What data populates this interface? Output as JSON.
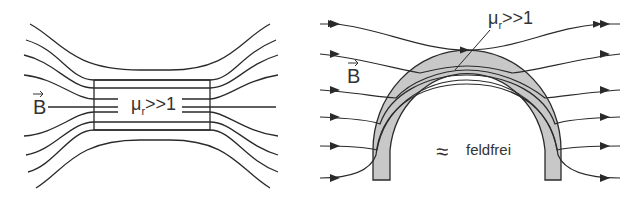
{
  "left_panel": {
    "field_label": "B",
    "material_label": {
      "symbol": "μ",
      "subscript": "r",
      "relation": ">>1"
    }
  },
  "right_panel": {
    "field_label": "B",
    "material_label": {
      "symbol": "μ",
      "subscript": "r",
      "relation": ">>1"
    },
    "interior_symbol": "≈",
    "interior_label": "feldfrei"
  },
  "colors": {
    "line": "#2a2a2a",
    "shell_fill": "#c8c8c8",
    "background": "#ffffff"
  }
}
